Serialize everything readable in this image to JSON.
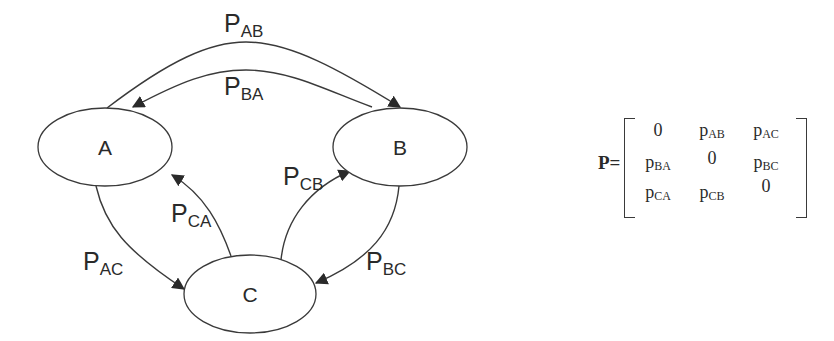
{
  "diagram": {
    "type": "markov-chain-state-diagram",
    "nodes": [
      {
        "id": "A",
        "label": "A"
      },
      {
        "id": "B",
        "label": "B"
      },
      {
        "id": "C",
        "label": "C"
      }
    ],
    "edges": [
      {
        "from": "A",
        "to": "B",
        "label_main": "P",
        "label_sub": "AB"
      },
      {
        "from": "B",
        "to": "A",
        "label_main": "P",
        "label_sub": "BA"
      },
      {
        "from": "A",
        "to": "C",
        "label_main": "P",
        "label_sub": "AC"
      },
      {
        "from": "C",
        "to": "A",
        "label_main": "P",
        "label_sub": "CA"
      },
      {
        "from": "C",
        "to": "B",
        "label_main": "P",
        "label_sub": "CB"
      },
      {
        "from": "B",
        "to": "C",
        "label_main": "P",
        "label_sub": "BC"
      }
    ]
  },
  "matrix": {
    "name": "P",
    "equals": "=",
    "rows": [
      [
        {
          "main": "0",
          "sub": ""
        },
        {
          "main": "p",
          "sub": "AB"
        },
        {
          "main": "p",
          "sub": "AC"
        }
      ],
      [
        {
          "main": "p",
          "sub": "BA"
        },
        {
          "main": "0",
          "sub": ""
        },
        {
          "main": "p",
          "sub": "BC"
        }
      ],
      [
        {
          "main": "p",
          "sub": "CA"
        },
        {
          "main": "p",
          "sub": "CB"
        },
        {
          "main": "0",
          "sub": ""
        }
      ]
    ]
  }
}
